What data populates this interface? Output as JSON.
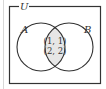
{
  "diagram": {
    "type": "venn",
    "universe_label": "U",
    "sets": [
      {
        "label": "A"
      },
      {
        "label": "B"
      }
    ],
    "intersection": {
      "elements": [
        "(1, 1)",
        "(2, 2)"
      ],
      "fill": "#e6e6e6"
    },
    "stroke_color": "#333333"
  }
}
